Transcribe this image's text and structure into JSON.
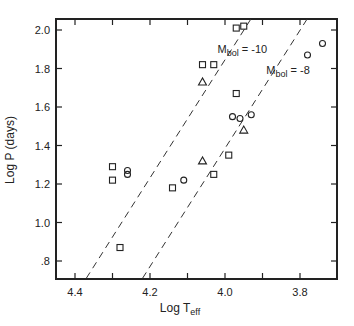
{
  "chart_data": {
    "type": "scatter",
    "title": "",
    "xlabel": "Log T",
    "xlabel_sub": "eff",
    "ylabel": "Log  P (days)",
    "xlim": [
      4.45,
      3.72
    ],
    "ylim": [
      0.7,
      2.06
    ],
    "x_reversed": true,
    "x_ticks": [
      4.4,
      4.3,
      4.2,
      4.1,
      4.0,
      3.9,
      3.8
    ],
    "x_tick_labels": [
      "4.4",
      "",
      "4.2",
      "",
      "4.0",
      "",
      "3.8"
    ],
    "y_ticks": [
      0.8,
      1.0,
      1.2,
      1.4,
      1.6,
      1.8,
      2.0
    ],
    "y_tick_labels": [
      ".8",
      "1.0",
      "1.2",
      "1.4",
      "1.6",
      "1.8",
      "2.0"
    ],
    "grid": false,
    "series": [
      {
        "name": "squares",
        "marker": "square",
        "points": [
          [
            4.3,
            1.29
          ],
          [
            4.3,
            1.22
          ],
          [
            4.28,
            0.87
          ],
          [
            4.14,
            1.18
          ],
          [
            4.06,
            1.82
          ],
          [
            4.03,
            1.82
          ],
          [
            4.03,
            1.25
          ],
          [
            3.99,
            1.35
          ],
          [
            3.97,
            1.67
          ],
          [
            3.97,
            2.01
          ],
          [
            3.95,
            2.02
          ]
        ]
      },
      {
        "name": "circles",
        "marker": "circle",
        "points": [
          [
            4.26,
            1.27
          ],
          [
            4.26,
            1.25
          ],
          [
            4.11,
            1.22
          ],
          [
            3.98,
            1.55
          ],
          [
            3.96,
            1.54
          ],
          [
            3.93,
            1.56
          ],
          [
            3.78,
            1.87
          ],
          [
            3.74,
            1.93
          ]
        ]
      },
      {
        "name": "triangles",
        "marker": "triangle",
        "points": [
          [
            4.06,
            1.73
          ],
          [
            4.06,
            1.32
          ],
          [
            3.95,
            1.48
          ]
        ]
      }
    ],
    "lines": [
      {
        "name": "Mbol = -10",
        "style": "dashed",
        "from": [
          4.37,
          0.71
        ],
        "to": [
          3.93,
          2.06
        ],
        "label_pos": [
          4.02,
          1.88
        ]
      },
      {
        "name": "Mbol = -8",
        "style": "dashed",
        "from": [
          4.22,
          0.71
        ],
        "to": [
          3.78,
          2.06
        ],
        "label_pos": [
          3.89,
          1.77
        ]
      }
    ],
    "annotations": [
      {
        "text": "M",
        "sub": "bol",
        "suffix": " = -10"
      },
      {
        "text": "M",
        "sub": "bol",
        "suffix": " = -8"
      }
    ]
  }
}
